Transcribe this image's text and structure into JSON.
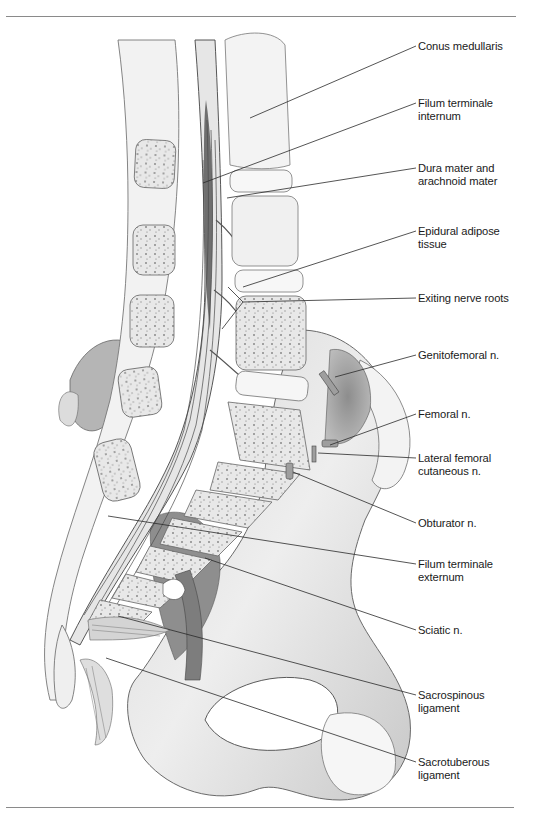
{
  "figure": {
    "labels": [
      {
        "id": "conus-medullaris",
        "lines": [
          "Conus medullaris"
        ],
        "x": 418,
        "y": 40,
        "targets": [
          [
            250,
            118
          ]
        ]
      },
      {
        "id": "filum-terminale-internum",
        "lines": [
          "Filum terminale",
          "internum"
        ],
        "x": 418,
        "y": 97,
        "targets": [
          [
            203,
            183
          ]
        ]
      },
      {
        "id": "dura-arachnoid",
        "lines": [
          "Dura mater and",
          "arachnoid mater"
        ],
        "x": 418,
        "y": 162,
        "targets": [
          [
            227,
            198
          ]
        ]
      },
      {
        "id": "epidural-adipose",
        "lines": [
          "Epidural adipose",
          "tissue"
        ],
        "x": 418,
        "y": 225,
        "targets": [
          [
            243,
            287
          ]
        ]
      },
      {
        "id": "exiting-nerve-roots",
        "lines": [
          "Exiting nerve roots"
        ],
        "x": 418,
        "y": 292,
        "targets": [
          [
            228,
            287
          ],
          [
            222,
            329
          ]
        ]
      },
      {
        "id": "genitofemoral-n",
        "lines": [
          "Genitofemoral n."
        ],
        "x": 418,
        "y": 349,
        "targets": [
          [
            335,
            377
          ]
        ]
      },
      {
        "id": "femoral-n",
        "lines": [
          "Femoral n."
        ],
        "x": 418,
        "y": 408,
        "targets": [
          [
            330,
            445
          ]
        ]
      },
      {
        "id": "lateral-femoral-cutaneous-n",
        "lines": [
          "Lateral femoral",
          "cutaneous n."
        ],
        "x": 418,
        "y": 452,
        "targets": [
          [
            318,
            453
          ]
        ]
      },
      {
        "id": "obturator-n",
        "lines": [
          "Obturator n."
        ],
        "x": 418,
        "y": 517,
        "targets": [
          [
            293,
            472
          ]
        ]
      },
      {
        "id": "filum-terminale-externum",
        "lines": [
          "Filum terminale",
          "externum"
        ],
        "x": 418,
        "y": 558,
        "targets": [
          [
            108,
            516
          ]
        ]
      },
      {
        "id": "sciatic-n",
        "lines": [
          "Sciatic n."
        ],
        "x": 418,
        "y": 624,
        "targets": [
          [
            205,
            558
          ]
        ]
      },
      {
        "id": "sacrospinous-ligament",
        "lines": [
          "Sacrospinous",
          "ligament"
        ],
        "x": 418,
        "y": 689,
        "targets": [
          [
            118,
            616
          ]
        ]
      },
      {
        "id": "sacrotuberous-ligament",
        "lines": [
          "Sacrotuberous",
          "ligament"
        ],
        "x": 418,
        "y": 756,
        "targets": [
          [
            106,
            658
          ]
        ]
      }
    ]
  },
  "colors": {
    "text": "#1a1a1a",
    "leader": "#2a2a2a",
    "rule": "#8a8a8a",
    "bone_fill": "#f1f1f1",
    "bone_line": "#6f6f6f",
    "shadow": "#9a9a9a"
  }
}
